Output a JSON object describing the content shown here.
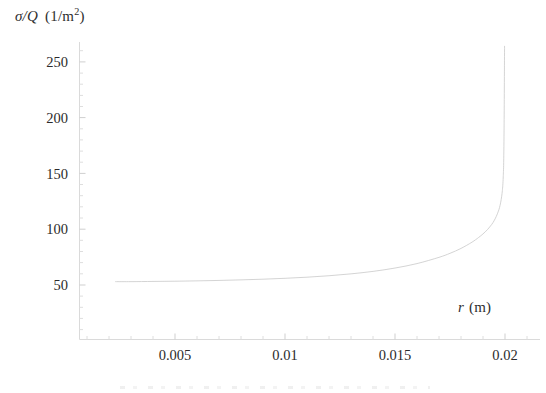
{
  "figure": {
    "background": "#ffffff",
    "curve_color": "#c9c9c9",
    "axis_color": "#d8d8d8",
    "tick_color": "#cfcfcf",
    "text_color": "#2b2b2b"
  },
  "labels": {
    "y_var": "σ/Q",
    "y_unit_open": "(1/m",
    "y_unit_exp": "2",
    "y_unit_close": ")",
    "y_full": "σ/Q  (1/m²)",
    "x_var": "r",
    "x_unit": "(m)",
    "x_full": "r (m)"
  },
  "yticks": [
    {
      "label": "250",
      "value": 250
    },
    {
      "label": "200",
      "value": 200
    },
    {
      "label": "150",
      "value": 150
    },
    {
      "label": "100",
      "value": 100
    },
    {
      "label": "50",
      "value": 50
    }
  ],
  "xticks": [
    {
      "label": "0.005",
      "value": 0.005
    },
    {
      "label": "0.01",
      "value": 0.01
    },
    {
      "label": "0.015",
      "value": 0.015
    },
    {
      "label": "0.02",
      "value": 0.02
    }
  ],
  "chart_data": {
    "type": "line",
    "title": "",
    "xlabel": "r (m)",
    "ylabel": "σ/Q (1/m²)",
    "xlim": [
      0.0015,
      0.0205
    ],
    "ylim": [
      0,
      270
    ],
    "xticks": [
      0.005,
      0.01,
      0.015,
      0.02
    ],
    "yticks": [
      50,
      100,
      150,
      200,
      250
    ],
    "minor_ticks": true,
    "grid": false,
    "legend": false,
    "series": [
      {
        "name": "σ/Q",
        "color": "#c9c9c9",
        "linewidth": 0.8,
        "x": [
          0.0023,
          0.003,
          0.004,
          0.005,
          0.006,
          0.007,
          0.008,
          0.009,
          0.01,
          0.011,
          0.012,
          0.013,
          0.014,
          0.015,
          0.016,
          0.017,
          0.0175,
          0.018,
          0.0185,
          0.0188,
          0.019,
          0.0192,
          0.0194,
          0.0195,
          0.0196,
          0.0197,
          0.01975,
          0.0198,
          0.01985,
          0.01988,
          0.0199,
          0.01992,
          0.01994,
          0.01996,
          0.01998
        ],
        "y": [
          53.0,
          53.0,
          53.2,
          53.4,
          53.7,
          54.1,
          54.6,
          55.2,
          56.0,
          57.0,
          58.3,
          60.0,
          62.2,
          65.2,
          69.2,
          74.8,
          78.4,
          82.8,
          88.4,
          92.6,
          95.8,
          99.6,
          104.4,
          107.5,
          111.3,
          116.2,
          119.4,
          123.6,
          129.6,
          134.6,
          139.4,
          147.0,
          160.0,
          195.0,
          264.0
        ]
      }
    ],
    "annotations": [
      {
        "text": "curve is flat near σ/Q ≈ 53 1/m² for small r and diverges as r → 0.02 m",
        "visible": false
      }
    ]
  }
}
